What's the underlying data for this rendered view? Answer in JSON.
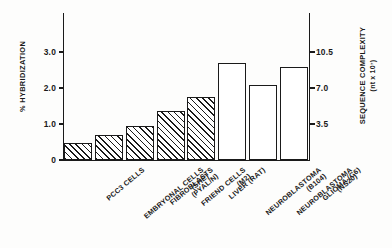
{
  "chart_data": {
    "type": "bar",
    "title": "",
    "categories": [
      "PCC3 CELLS",
      "EMBRYONAL CELLS (SHE)",
      "FIBROBLASTS (PYAL/N)",
      "FRIEND CELLS (M2)",
      "LIVER (RAT)",
      "NEUROBLASTOMA (B104)",
      "NEUROBLASTOMA (NS20)",
      "GLIOMA (C6)"
    ],
    "values": [
      0.47,
      0.69,
      0.95,
      1.35,
      1.74,
      2.69,
      2.08,
      2.58
    ],
    "xlabel": "",
    "ylabel": "% HYBRIDIZATION",
    "ylim": [
      0,
      3.5
    ],
    "y2label": "SEQUENCE COMPLEXITY (nt x 10⁷)",
    "y2lim": [
      0,
      12.25
    ],
    "grid": false,
    "legend": "none"
  },
  "axes": {
    "left": {
      "label": "% HYBRIDIZATION",
      "ticks": [
        {
          "value": 0,
          "text": "0"
        },
        {
          "value": 1.0,
          "text": "1.0"
        },
        {
          "value": 2.0,
          "text": "2.0"
        },
        {
          "value": 3.0,
          "text": "3.0"
        }
      ]
    },
    "right": {
      "label_line1": "SEQUENCE COMPLEXITY",
      "label_line2": "(nt x 10⁷)",
      "ticks": [
        {
          "value": 3.5,
          "text": "3.5"
        },
        {
          "value": 7.0,
          "text": "7.0"
        },
        {
          "value": 10.5,
          "text": "10.5"
        }
      ]
    }
  },
  "bars": [
    {
      "name": "PCC3 CELLS",
      "label_line1": "PCC3 CELLS",
      "label_line2": "",
      "value": 0.47,
      "style": "hatched"
    },
    {
      "name": "EMBRYONAL CELLS",
      "label_line1": "EMBRYONAL CELLS",
      "label_line2": "(SHE)",
      "value": 0.69,
      "style": "hatched"
    },
    {
      "name": "FIBROBLASTS",
      "label_line1": "FIBROBLASTS",
      "label_line2": "(PYAL/N)",
      "value": 0.95,
      "style": "hatched"
    },
    {
      "name": "FRIEND CELLS",
      "label_line1": "FRIEND CELLS",
      "label_line2": "(M2)",
      "value": 1.35,
      "style": "hatched"
    },
    {
      "name": "LIVER (RAT)",
      "label_line1": "LIVER (RAT)",
      "label_line2": "",
      "value": 1.74,
      "style": "hatched"
    },
    {
      "name": "NEUROBLASTOMA B104",
      "label_line1": "NEUROBLASTOMA",
      "label_line2": "(B104)",
      "value": 2.69,
      "style": "open"
    },
    {
      "name": "NEUROBLASTOMA NS20",
      "label_line1": "NEUROBLASTOMA",
      "label_line2": "(NS20)",
      "value": 2.08,
      "style": "open"
    },
    {
      "name": "GLIOMA (C6)",
      "label_line1": "GLIOMA (C6)",
      "label_line2": "",
      "value": 2.58,
      "style": "open"
    }
  ],
  "colors": {
    "ink": "#1a1a1a",
    "background": "#fdfdfc",
    "bar_fill": "#ffffff"
  }
}
